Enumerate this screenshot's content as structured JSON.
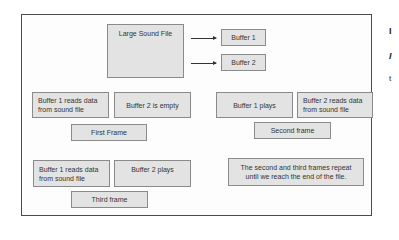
{
  "diagram": {
    "source": {
      "label": "Large Sound File"
    },
    "buffers": [
      {
        "label": "Buffer 1"
      },
      {
        "label": "Buffer 2"
      }
    ],
    "first_frame": {
      "label": "First Frame",
      "buffer1": "Buffer 1 reads data from sound file",
      "buffer2": "Buffer 2 is empty"
    },
    "second_frame": {
      "label": "Second frame",
      "buffer1": "Buffer 1 plays",
      "buffer2": "Buffer 2 reads data from sound file"
    },
    "third_frame": {
      "label": "Third frame",
      "buffer1": "Buffer 1 reads data from sound file",
      "buffer2": "Buffer 2 plays"
    },
    "note": "The second and third frames repeat until we reach the end of the file."
  },
  "margin_glyphs": [
    "I",
    "I",
    "t"
  ],
  "colors": {
    "box_fill": "#e3e3e3",
    "box_border": "#8a8a8a",
    "frame_border": "#4a4a4a",
    "text": "#333333"
  }
}
